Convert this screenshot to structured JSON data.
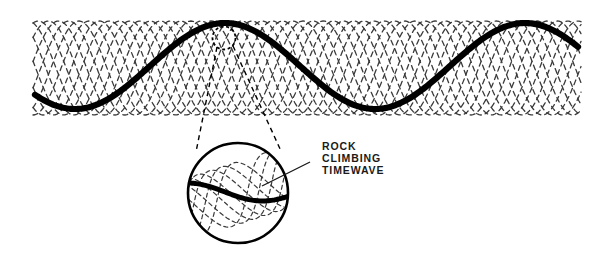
{
  "figure": {
    "title": "Rock Climbing Timewave",
    "background_color": "#ffffff",
    "width": 602,
    "height": 256
  },
  "callout": {
    "line1": "ROCK",
    "line2": "CLIMBING",
    "line3": "TIMEWAVE",
    "text_color": "#1a1a1a",
    "leader_line": {
      "x1": 310,
      "y1": 162,
      "x2": 262,
      "y2": 186
    }
  },
  "chart_data": {
    "type": "line",
    "title": "Rock Climbing Timewave",
    "xlabel": "",
    "ylabel": "",
    "grid": false,
    "legend": null,
    "xlim": [
      33,
      580
    ],
    "ylim": [
      20,
      118
    ],
    "series": [
      {
        "name": "rock-climbing-timewave",
        "role": "main-bold-wave",
        "style": "solid",
        "color": "#000000",
        "stroke_width": 6.2,
        "amplitude": 43,
        "midline_y": 66,
        "wavelength": 300,
        "phase_deg": 180,
        "x_start": 35,
        "x_end": 578,
        "description": "Bold solid sine wave spanning the band; trough near x=150, crest near x=255 rising to right edge"
      },
      {
        "name": "lattice-waves",
        "role": "background-dashed-lattice",
        "style": "dashed",
        "color": "#3a3a3a",
        "stroke_width": 1.3,
        "dash_pattern": [
          5,
          4
        ],
        "count": 11,
        "amplitude": 47,
        "midline_y": 68,
        "wavelength": 112,
        "phase_step_deg": 32.7,
        "x_start": 33,
        "x_end": 581,
        "description": "Eleven overlapping dashed sine waves at staggered phases forming a woven diamond lattice band"
      }
    ],
    "band": {
      "top_y": 21,
      "bottom_y": 116
    }
  },
  "magnifier": {
    "small_circle": {
      "name": "focus-ring",
      "cx": 224,
      "cy": 38,
      "r": 11.5,
      "stroke": "#000000",
      "stroke_width": 1.8,
      "dashed": true,
      "dash_pattern": [
        3,
        2.6
      ]
    },
    "cone": {
      "name": "magnifier-cone",
      "stroke": "#000000",
      "stroke_width": 1.4,
      "dashed": true,
      "dash_pattern": [
        5,
        4
      ],
      "left_line": {
        "x1": 217,
        "y1": 47,
        "x2": 196,
        "y2": 152
      },
      "right_line": {
        "x1": 233,
        "y1": 46,
        "x2": 281,
        "y2": 151
      }
    },
    "big_circle": {
      "name": "magnified-view",
      "cx": 238,
      "cy": 193,
      "r": 50,
      "stroke": "#000000",
      "stroke_width": 2.6
    },
    "magnified_content": {
      "bold_wave": {
        "name": "magnified-timewave",
        "color": "#000000",
        "stroke_width": 5.0,
        "amplitude": 9,
        "midline_y": 192,
        "wavelength": 150,
        "phase_deg": 0
      },
      "lattice": {
        "name": "magnified-lattice",
        "color": "#3a3a3a",
        "stroke_width": 1.2,
        "dash_pattern": [
          4,
          3.4
        ],
        "count": 7,
        "amplitude": 30,
        "wavelength": 108,
        "phase_step_deg": 42,
        "tilt_deg": -18
      }
    }
  }
}
